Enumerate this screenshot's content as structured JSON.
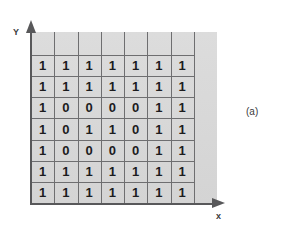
{
  "figure": {
    "caption": "(a)",
    "axis": {
      "y_label": "Y",
      "x_label": "x"
    },
    "colors": {
      "plot_background": "#d7d7d7",
      "grid_line": "#6e6e70",
      "axis": "#58585a",
      "digit": "#1c1c1e",
      "page_background": "#ffffff"
    }
  },
  "chart_data": {
    "type": "heatmap",
    "title": "",
    "subtitle": "",
    "xlabel": "x",
    "ylabel": "Y",
    "legend": [],
    "annotations": [
      "(a)"
    ],
    "grid": true,
    "rows": 7,
    "cols": 7,
    "empty_trailing_cols": 1,
    "empty_leading_rows": 1,
    "values": [
      [
        1,
        1,
        1,
        1,
        1,
        1,
        1
      ],
      [
        1,
        1,
        1,
        1,
        1,
        1,
        1
      ],
      [
        1,
        0,
        0,
        0,
        0,
        1,
        1
      ],
      [
        1,
        0,
        1,
        1,
        0,
        1,
        1
      ],
      [
        1,
        0,
        0,
        0,
        0,
        1,
        1
      ],
      [
        1,
        1,
        1,
        1,
        1,
        1,
        1
      ],
      [
        1,
        1,
        1,
        1,
        1,
        1,
        1
      ]
    ],
    "cell_labels": [
      [
        "1",
        "1",
        "1",
        "1",
        "1",
        "1",
        "1"
      ],
      [
        "1",
        "1",
        "1",
        "1",
        "1",
        "1",
        "1"
      ],
      [
        "1",
        "0",
        "0",
        "0",
        "0",
        "1",
        "1"
      ],
      [
        "1",
        "0",
        "1",
        "1",
        "0",
        "1",
        "1"
      ],
      [
        "1",
        "0",
        "0",
        "0",
        "0",
        "1",
        "1"
      ],
      [
        "1",
        "1",
        "1",
        "1",
        "1",
        "1",
        "1"
      ],
      [
        "1",
        "1",
        "1",
        "1",
        "1",
        "1",
        "1"
      ]
    ]
  }
}
